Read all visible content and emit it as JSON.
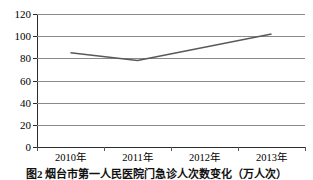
{
  "chart_data": {
    "type": "line",
    "title": "",
    "categories": [
      "2010年",
      "2011年",
      "2012年",
      "2013年"
    ],
    "values": [
      85,
      78,
      90,
      102
    ],
    "series": [
      {
        "name": "门急诊人次数",
        "values": [
          85,
          78,
          90,
          102
        ]
      }
    ],
    "xlabel": "",
    "ylabel": "",
    "ylim": [
      0,
      120
    ],
    "y_ticks": [
      0,
      20,
      40,
      60,
      80,
      100,
      120
    ],
    "y_tick_labels": [
      "0",
      "20",
      "40",
      "60",
      "80",
      "100",
      "120"
    ],
    "grid": true,
    "legend": false,
    "legend_position": "none",
    "line_color": "#595959",
    "axis_color": "#2b2b2b",
    "gridline_color": "#8a8a8a"
  },
  "caption": {
    "text": "图2 烟台市第一人民医院门急诊人次数变化（万人次）"
  }
}
